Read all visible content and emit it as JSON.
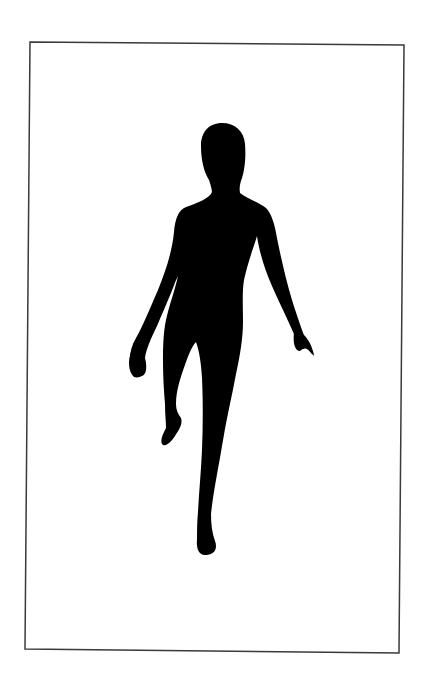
{
  "image": {
    "description": "Black silhouette of a person standing on one leg with the other knee raised, inside a thin rectangular frame",
    "background_color": "#ffffff",
    "frame": {
      "stroke_color": "#3a3a3a",
      "stroke_width": 1.5,
      "corners": {
        "top_left": [
          30,
          42
        ],
        "top_right": [
          404,
          45
        ],
        "bottom_right": [
          399,
          653
        ],
        "bottom_left": [
          25,
          649
        ]
      }
    },
    "figure": {
      "fill_color": "#000000",
      "pose": "standing on right leg, left knee raised, arms slightly out from body"
    }
  }
}
